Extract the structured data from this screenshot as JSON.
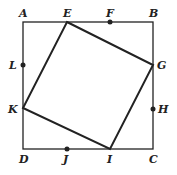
{
  "diagram": {
    "outer_square": [
      "A",
      "B",
      "C",
      "D"
    ],
    "inner_square": [
      "E",
      "G",
      "I",
      "K"
    ],
    "points": {
      "A": {
        "label": "A",
        "x": 23,
        "y": 22,
        "dot": false
      },
      "B": {
        "label": "B",
        "x": 153,
        "y": 22,
        "dot": false
      },
      "C": {
        "label": "C",
        "x": 153,
        "y": 149,
        "dot": false
      },
      "D": {
        "label": "D",
        "x": 23,
        "y": 149,
        "dot": false
      },
      "E": {
        "label": "E",
        "x": 67,
        "y": 22,
        "dot": false
      },
      "F": {
        "label": "F",
        "x": 110,
        "y": 22,
        "dot": true
      },
      "G": {
        "label": "G",
        "x": 153,
        "y": 65,
        "dot": false
      },
      "H": {
        "label": "H",
        "x": 153,
        "y": 109,
        "dot": true
      },
      "I": {
        "label": "I",
        "x": 110,
        "y": 149,
        "dot": false
      },
      "J": {
        "label": "J",
        "x": 67,
        "y": 149,
        "dot": true
      },
      "K": {
        "label": "K",
        "x": 23,
        "y": 108,
        "dot": false
      },
      "L": {
        "label": "L",
        "x": 23,
        "y": 65,
        "dot": true
      }
    },
    "colors": {
      "line": "#222222",
      "background": "#ffffff"
    }
  }
}
